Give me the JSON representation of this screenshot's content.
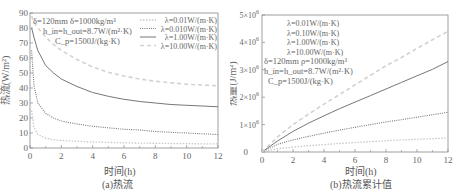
{
  "chart_data": [
    {
      "type": "line",
      "title": "",
      "caption": "(a)热流",
      "xlabel": "时间(h)",
      "ylabel": "热流(W/m²)",
      "xlim": [
        0,
        12
      ],
      "ylim": [
        0,
        90
      ],
      "xticks": [
        0,
        2,
        4,
        6,
        8,
        10,
        12
      ],
      "yticks": [
        0,
        10,
        20,
        30,
        40,
        50,
        60,
        70,
        80,
        90
      ],
      "grid": false,
      "legend_position": "upper right",
      "annotations": [
        "δ=120mm  δ=1000kg/m³",
        "h_in=h_out=8.7W/(m²·K)",
        "C_p=1500J/(kg·K)"
      ],
      "x": [
        0.1,
        0.25,
        0.5,
        1,
        1.5,
        2,
        3,
        4,
        5,
        6,
        7,
        8,
        9,
        10,
        11,
        12
      ],
      "series": [
        {
          "name": "λ=0.01W/(m·K)",
          "style": "light-dot",
          "values": [
            25,
            14,
            9,
            6.5,
            5.5,
            5,
            4.5,
            4,
            3.7,
            3.5,
            3.3,
            3.1,
            3,
            2.9,
            2.8,
            2.7
          ]
        },
        {
          "name": "λ=0.010W/(m·K)",
          "style": "dotted",
          "values": [
            65,
            42,
            30,
            23,
            20,
            18,
            16,
            14.5,
            13.5,
            12.5,
            12,
            11,
            10.5,
            10,
            9.5,
            9
          ]
        },
        {
          "name": "λ=1.00W/(m·K)",
          "style": "solid",
          "values": [
            80,
            74,
            65,
            55,
            50,
            46,
            41,
            37,
            34.5,
            32.5,
            31,
            30,
            29,
            28.5,
            28,
            27.5
          ]
        },
        {
          "name": "λ=10.00W/(m·K)",
          "style": "dashed",
          "values": [
            88,
            84,
            80,
            74,
            69,
            65,
            59,
            54,
            50.5,
            48,
            46,
            44.5,
            43.5,
            42.5,
            42,
            41.5
          ]
        }
      ]
    },
    {
      "type": "line",
      "title": "",
      "caption": "(b)热流累计值",
      "xlabel": "时间(h)",
      "ylabel": "热量(J/m²)",
      "xlim": [
        0,
        12
      ],
      "ylim": [
        0,
        5000000
      ],
      "xticks": [
        0,
        2,
        4,
        6,
        8,
        10,
        12
      ],
      "yticks": [
        "0",
        "1×10⁶",
        "2×10⁶",
        "3×10⁶",
        "4×10⁶",
        "5×10⁶"
      ],
      "grid": false,
      "legend_position": "upper left",
      "annotations": [
        "δ=120mm  ρ=1000kg/m³",
        "h_in=h_out=8.7W/(m²·K)",
        "C_p=1500J/(kg·K)"
      ],
      "x": [
        0,
        1,
        2,
        3,
        4,
        5,
        6,
        7,
        8,
        9,
        10,
        11,
        12
      ],
      "series": [
        {
          "name": "λ=0.01W/(m·K)",
          "style": "light-dot",
          "values": [
            0,
            120000,
            180000,
            230000,
            270000,
            310000,
            345000,
            380000,
            410000,
            440000,
            465000,
            490000,
            510000
          ]
        },
        {
          "name": "λ=0.10W/(m·K)",
          "style": "dotted",
          "values": [
            0,
            280000,
            440000,
            570000,
            690000,
            800000,
            900000,
            1000000,
            1100000,
            1180000,
            1270000,
            1360000,
            1450000
          ]
        },
        {
          "name": "λ=1.00W/(m·K)",
          "style": "solid",
          "values": [
            0,
            400000,
            750000,
            1050000,
            1320000,
            1580000,
            1820000,
            2060000,
            2300000,
            2540000,
            2780000,
            3020000,
            3300000
          ]
        },
        {
          "name": "λ=10.00W/(m·K)",
          "style": "dashed",
          "values": [
            0,
            550000,
            1000000,
            1380000,
            1750000,
            2100000,
            2450000,
            2800000,
            3150000,
            3450000,
            3780000,
            4100000,
            4400000
          ]
        }
      ]
    }
  ],
  "panel_a": {
    "caption": "(a)热流",
    "xlabel": "时间(h)",
    "ylabel": "热流(W/m²)",
    "params": {
      "line1": "δ=120mm  δ=1000kg/m³",
      "line2": "h_in=h_out=8.7W/(m²·K)",
      "line3": "C_p=1500J/(kg·K)"
    },
    "legend": [
      "λ=0.01W/(m·K)",
      "λ=0.010W/(m·K)",
      "λ=1.00W/(m·K)",
      "λ=10.00W/(m·K)"
    ]
  },
  "panel_b": {
    "caption": "(b)热流累计值",
    "xlabel": "时间(h)",
    "ylabel": "热量(J/m²)",
    "params": {
      "line1": "δ=120mm  ρ=1000kg/m³",
      "line2": "h_in=h_out=8.7W/(m²·K)",
      "line3": "C_p=1500J/(kg·K)"
    },
    "legend": [
      "λ=0.01W/(m·K)",
      "λ=0.10W/(m·K)",
      "λ=1.00W/(m·K)",
      "λ=10.00W/(m·K)"
    ]
  },
  "styles": {
    "light-dot": {
      "color": "#c8c8c8",
      "dash": "1.5,1.5",
      "width": 1.3
    },
    "dotted": {
      "color": "#777777",
      "dash": "1,1.2",
      "width": 1.1
    },
    "solid": {
      "color": "#777777",
      "dash": "",
      "width": 1.0
    },
    "dashed": {
      "color": "#d2d2d2",
      "dash": "4,3",
      "width": 1.6
    }
  }
}
